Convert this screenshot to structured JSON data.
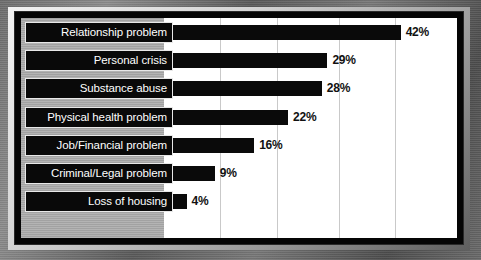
{
  "chart_data": {
    "type": "bar",
    "orientation": "horizontal",
    "title": "",
    "subtitle": "",
    "xlabel": "",
    "ylabel": "",
    "xlim": [
      0,
      52
    ],
    "grid": true,
    "gridline_values": [
      10,
      20,
      31,
      41
    ],
    "legend": "none",
    "value_suffix": "%",
    "categories": [
      "Relationship problem",
      "Personal crisis",
      "Substance abuse",
      "Physical health problem",
      "Job/Financial problem",
      "Criminal/Legal problem",
      "Loss of housing"
    ],
    "values": [
      42,
      29,
      28,
      22,
      16,
      9,
      4
    ],
    "value_labels": [
      "42%",
      "29%",
      "28%",
      "22%",
      "16%",
      "9%",
      "4%"
    ],
    "bars": [
      {
        "label": "Relationship problem",
        "value": 42,
        "value_label": "42%"
      },
      {
        "label": "Personal crisis",
        "value": 29,
        "value_label": "29%"
      },
      {
        "label": "Substance abuse",
        "value": 28,
        "value_label": "28%"
      },
      {
        "label": "Physical health problem",
        "value": 22,
        "value_label": "22%"
      },
      {
        "label": "Job/Financial problem",
        "value": 16,
        "value_label": "16%"
      },
      {
        "label": "Criminal/Legal problem",
        "value": 9,
        "value_label": "9%"
      },
      {
        "label": "Loss of housing",
        "value": 4,
        "value_label": "4%"
      }
    ],
    "colors": {
      "bar": "#0a0a0a",
      "plot_background": "#ffffff",
      "label_band": "#a9a9a9",
      "label_box": "#090909",
      "label_text": "#ffffff",
      "value_text": "#111111",
      "gridline": "#c9c9c9",
      "frame": "#050505"
    }
  }
}
